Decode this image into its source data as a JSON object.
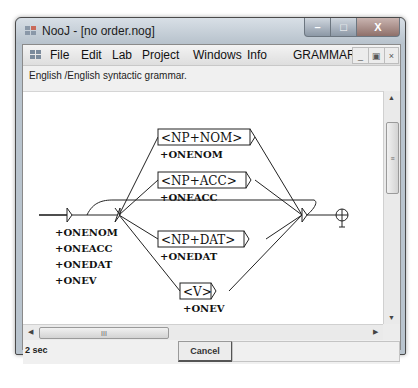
{
  "window": {
    "title": "NooJ - [no order.nog]",
    "controls": {
      "minimize": "–",
      "maximize": "□",
      "close": "X"
    }
  },
  "menubar": {
    "items": [
      "File",
      "Edit",
      "Lab",
      "Project",
      "Windows",
      "Info"
    ],
    "right_label": "GRAMMAR",
    "mdi_controls": {
      "minimize": "_",
      "restore": "▣",
      "close": "×"
    }
  },
  "description": "English /English syntactic grammar.",
  "graph": {
    "initial_outputs": [
      "+ONENOM",
      "+ONEACC",
      "+ONEDAT",
      "+ONEV"
    ],
    "nodes": [
      {
        "label": "<NP+NOM>",
        "output": "+ONENOM"
      },
      {
        "label": "<NP+ACC>",
        "output": "+ONEACC"
      },
      {
        "label": "<NP+DAT>",
        "output": "+ONEDAT"
      },
      {
        "label": "<V>",
        "output": "+ONEV"
      }
    ],
    "terminal_icon": "final-node-icon"
  },
  "scrollbars": {
    "vertical_grip": "≡",
    "horizontal_grip": "III",
    "up": "▲",
    "down": "▼",
    "left": "◀",
    "right": "▶"
  },
  "status": {
    "time": "2 sec",
    "cancel_label": "Cancel"
  },
  "colors": {
    "frame": "#b9c4ce",
    "canvas": "#ffffff",
    "graph_stroke": "#222222"
  }
}
